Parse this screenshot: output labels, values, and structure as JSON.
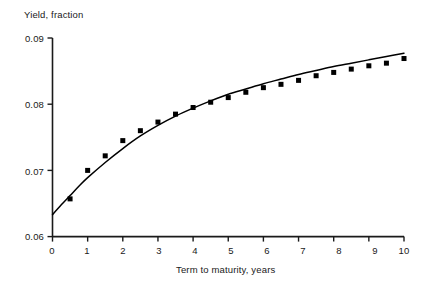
{
  "chart_data": {
    "type": "scatter",
    "title": "",
    "xlabel": "Term to maturity, years",
    "ylabel": "Yield, fraction",
    "xlim": [
      0,
      10
    ],
    "ylim": [
      0.06,
      0.09
    ],
    "grid": false,
    "legend": null,
    "xticks": [
      "0",
      "1",
      "2",
      "3",
      "4",
      "5",
      "6",
      "7",
      "8",
      "9",
      "10"
    ],
    "xtick_values": [
      0,
      1,
      2,
      3,
      4,
      5,
      6,
      7,
      8,
      9,
      10
    ],
    "yticks": [
      "0.06",
      "0.07",
      "0.08",
      "0.09"
    ],
    "ytick_values": [
      0.06,
      0.07,
      0.08,
      0.09
    ],
    "series": [
      {
        "name": "Observed yields",
        "marker": "square",
        "color": "#000000",
        "x": [
          0.5,
          1.0,
          1.5,
          2.0,
          2.5,
          3.0,
          3.5,
          4.0,
          4.5,
          5.0,
          5.5,
          6.0,
          6.5,
          7.0,
          7.5,
          8.0,
          8.5,
          9.0,
          9.5,
          10.0
        ],
        "y": [
          0.0657,
          0.07,
          0.0722,
          0.0745,
          0.076,
          0.0773,
          0.0785,
          0.0795,
          0.0803,
          0.081,
          0.0818,
          0.0825,
          0.083,
          0.0836,
          0.0843,
          0.0848,
          0.0853,
          0.0858,
          0.0862,
          0.0869
        ]
      },
      {
        "name": "Fitted curve",
        "marker": "none",
        "color": "#000000",
        "x": [
          0.0,
          0.25,
          0.5,
          0.75,
          1.0,
          1.5,
          2.0,
          2.5,
          3.0,
          3.5,
          4.0,
          4.5,
          5.0,
          5.5,
          6.0,
          6.5,
          7.0,
          7.5,
          8.0,
          8.5,
          9.0,
          9.5,
          10.0
        ],
        "y": [
          0.0633,
          0.0648,
          0.0662,
          0.0676,
          0.0689,
          0.0712,
          0.0733,
          0.0752,
          0.0768,
          0.0782,
          0.0794,
          0.0805,
          0.0815,
          0.0823,
          0.0831,
          0.0838,
          0.0845,
          0.0851,
          0.0857,
          0.0862,
          0.0867,
          0.0872,
          0.0877
        ]
      }
    ]
  },
  "axes": {
    "y_title": "Yield, fraction",
    "x_title": "Term to maturity, years",
    "y_tick_labels": [
      "0.09",
      "0.08",
      "0.07",
      "0.06"
    ],
    "x_tick_labels": [
      "0",
      "1",
      "2",
      "3",
      "4",
      "5",
      "6",
      "7",
      "8",
      "9",
      "10"
    ]
  },
  "colors": {
    "axis": "#1a1a1a",
    "marker": "#000000",
    "curve": "#000000",
    "background": "#ffffff"
  }
}
